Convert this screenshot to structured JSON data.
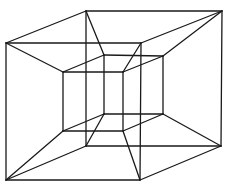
{
  "figure": {
    "title": "",
    "line_color": "#1a1a1a",
    "background_color": "#ffffff",
    "vertices": {
      "outer_front_tl": [
        6,
        43
      ],
      "outer_front_tr": [
        141,
        43
      ],
      "outer_front_br": [
        140,
        180
      ],
      "outer_front_bl": [
        6,
        180
      ],
      "outer_back_tl": [
        86,
        11
      ],
      "outer_back_tr": [
        222,
        11
      ],
      "outer_back_br": [
        221,
        146
      ],
      "outer_back_bl": [
        86,
        146
      ],
      "inner_front_tl": [
        63,
        72
      ],
      "inner_front_tr": [
        123,
        72
      ],
      "inner_front_br": [
        123,
        131
      ],
      "inner_front_bl": [
        63,
        131
      ],
      "inner_back_tl": [
        104,
        55
      ],
      "inner_back_tr": [
        163,
        56
      ],
      "inner_back_br": [
        163,
        114
      ],
      "inner_back_bl": [
        104,
        114
      ]
    },
    "edges": [
      [
        "outer_front_tl",
        "outer_front_tr"
      ],
      [
        "outer_front_tr",
        "outer_front_br"
      ],
      [
        "outer_front_br",
        "outer_front_bl"
      ],
      [
        "outer_front_bl",
        "outer_front_tl"
      ],
      [
        "outer_back_tl",
        "outer_back_tr"
      ],
      [
        "outer_back_tr",
        "outer_back_br"
      ],
      [
        "outer_back_br",
        "outer_back_bl"
      ],
      [
        "outer_back_bl",
        "outer_back_tl"
      ],
      [
        "outer_front_tl",
        "outer_back_tl"
      ],
      [
        "outer_front_tr",
        "outer_back_tr"
      ],
      [
        "outer_front_br",
        "outer_back_br"
      ],
      [
        "outer_front_bl",
        "outer_back_bl"
      ],
      [
        "inner_front_tl",
        "inner_front_tr"
      ],
      [
        "inner_front_tr",
        "inner_front_br"
      ],
      [
        "inner_front_br",
        "inner_front_bl"
      ],
      [
        "inner_front_bl",
        "inner_front_tl"
      ],
      [
        "inner_back_tl",
        "inner_back_tr"
      ],
      [
        "inner_back_tr",
        "inner_back_br"
      ],
      [
        "inner_back_br",
        "inner_back_bl"
      ],
      [
        "inner_back_bl",
        "inner_back_tl"
      ],
      [
        "inner_front_tl",
        "inner_back_tl"
      ],
      [
        "inner_front_tr",
        "inner_back_tr"
      ],
      [
        "inner_front_br",
        "inner_back_br"
      ],
      [
        "inner_front_bl",
        "inner_back_bl"
      ],
      [
        "outer_front_tl",
        "inner_front_tl"
      ],
      [
        "outer_front_tr",
        "inner_front_tr"
      ],
      [
        "outer_front_br",
        "inner_front_br"
      ],
      [
        "outer_front_bl",
        "inner_front_bl"
      ],
      [
        "outer_back_tl",
        "inner_back_tl"
      ],
      [
        "outer_back_tr",
        "inner_back_tr"
      ],
      [
        "outer_back_br",
        "inner_back_br"
      ],
      [
        "outer_back_bl",
        "inner_back_bl"
      ]
    ]
  }
}
